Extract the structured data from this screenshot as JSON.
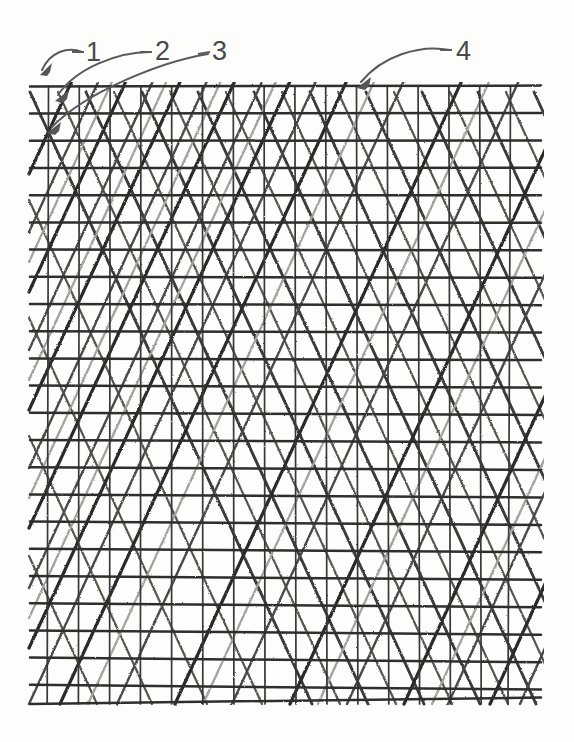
{
  "figure": {
    "kind": "patent-line-drawing",
    "background_color": "#fdfdfc",
    "ink_color": "#2b2b2b",
    "light_ink_color": "#9a9a96",
    "label_color": "#4a4a4a"
  },
  "callouts": [
    {
      "id": "callout-1",
      "label": "1",
      "label_x": 86,
      "label_y": 39,
      "leader_path": "M 82 52 C 68 46, 50 52, 42 70",
      "arrow_tip_x": 40,
      "arrow_tip_y": 75,
      "arrow_angle_deg": 118
    },
    {
      "id": "callout-2",
      "label": "2",
      "label_x": 155,
      "label_y": 38,
      "leader_path": "M 150 52 C 118 52, 76 68, 58 95",
      "arrow_tip_x": 55,
      "arrow_tip_y": 101,
      "arrow_angle_deg": 122
    },
    {
      "id": "callout-3",
      "label": "3",
      "label_x": 212,
      "label_y": 38,
      "leader_path": "M 208 54 C 160 62, 86 92, 52 127",
      "arrow_tip_x": 47,
      "arrow_tip_y": 133,
      "arrow_angle_deg": 131
    },
    {
      "id": "callout-4",
      "label": "4",
      "label_x": 456,
      "label_y": 38,
      "leader_path": "M 450 50 C 420 44, 382 56, 361 82",
      "arrow_tip_x": 357,
      "arrow_tip_y": 88,
      "arrow_angle_deg": 125
    }
  ],
  "mesh": {
    "left": 29,
    "right": 541,
    "top": 86,
    "bottom": 704,
    "horizontal_count": 23,
    "horizontal_spacing": 27.2,
    "vertical_count": 16,
    "vertical_spacing": 30.8,
    "vertical_first_x": 48,
    "diagonal_up_slope_deg": -38,
    "diagonal_down_slope_deg": 38,
    "diagonal_spacing": 56
  }
}
